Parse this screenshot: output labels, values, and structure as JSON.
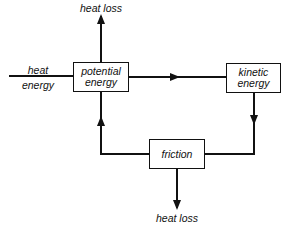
{
  "diagram": {
    "title": "",
    "nodes": {
      "potential": {
        "line1": "potential",
        "line2": "energy"
      },
      "kinetic": {
        "line1": "kinetic",
        "line2": "energy"
      },
      "friction": {
        "label": "friction"
      }
    },
    "labels": {
      "input_line1": "heat",
      "input_line2": "energy",
      "heat_loss_top": "heat loss",
      "heat_loss_bottom": "heat loss"
    },
    "edges": [
      {
        "from": "heat energy input",
        "to": "potential energy"
      },
      {
        "from": "potential energy",
        "to": "heat loss (top)"
      },
      {
        "from": "potential energy",
        "to": "kinetic energy"
      },
      {
        "from": "kinetic energy",
        "to": "friction"
      },
      {
        "from": "friction",
        "to": "potential energy"
      },
      {
        "from": "friction",
        "to": "heat loss (bottom)"
      }
    ],
    "colors": {
      "stroke": "#111111",
      "background": "#ffffff"
    }
  }
}
